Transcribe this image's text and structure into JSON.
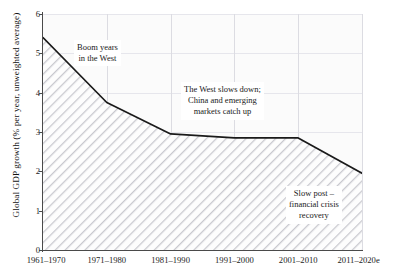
{
  "chart_data": {
    "type": "area",
    "title": "",
    "subtitle": "",
    "xlabel": "",
    "ylabel": "Global GDP growth (% per year, unweighted average)",
    "categories": [
      "1961–1970",
      "1971–1980",
      "1981–1990",
      "1991–2000",
      "2001–2010",
      "2011–2020e"
    ],
    "values": [
      5.4,
      3.75,
      2.95,
      2.85,
      2.85,
      1.95
    ],
    "series": [
      {
        "name": "Global GDP growth",
        "values": [
          5.4,
          3.75,
          2.95,
          2.85,
          2.85,
          1.95
        ]
      }
    ],
    "ylim": [
      0,
      6
    ],
    "yticks": [
      0,
      1,
      2,
      3,
      4,
      5,
      6
    ],
    "ytick_labels": [
      "0",
      "1",
      "2",
      "3",
      "4",
      "5",
      "6"
    ],
    "grid": true,
    "legend": "none",
    "area_fill": "diagonal-hatch",
    "line_color": "#1a1a1a",
    "hatch_color": "#c9c9cf",
    "grid_color": "#dcdce2",
    "background_color": "#fbfbfb",
    "annotations": [
      {
        "id": "boom-years",
        "text": "Boom years\nin the West",
        "x_category": "1961–1970",
        "y_value": 5.0
      },
      {
        "id": "west-slows",
        "text": "The West slows down;\nChina and emerging\nmarkets catch up",
        "x_category": "1991–2000",
        "y_value": 3.9
      },
      {
        "id": "slow-recovery",
        "text": "Slow post –\nfinancial crisis\nrecovery",
        "x_category": "2011–2020e",
        "y_value": 1.5
      }
    ]
  }
}
